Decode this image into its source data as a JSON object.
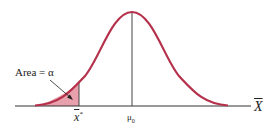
{
  "figure": {
    "area_label": "Area = α",
    "critical_value_label": "x",
    "critical_value_sup": "*",
    "mean_label": "μ",
    "mean_sub": "0",
    "axis_label": "X",
    "colors": {
      "curve": "#b5304a",
      "shaded": "#e8a0ac",
      "axis": "#333333"
    }
  }
}
